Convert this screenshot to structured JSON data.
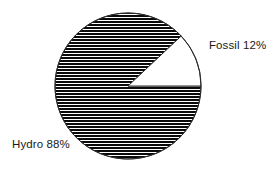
{
  "chart_data": {
    "type": "pie",
    "title": "",
    "labels": [
      "Hydro",
      "Fossil"
    ],
    "values": [
      88,
      12
    ],
    "value_unit": "%",
    "slice_labels": [
      "Hydro 88%",
      "Fossil 12%"
    ],
    "legend": "none",
    "grid": false,
    "slices": [
      {
        "name": "Hydro",
        "value": 88,
        "display": "Hydro 88%",
        "fill": "horizontal-hatch",
        "fill_color": "#000000",
        "start_angle_deg": 0,
        "end_angle_deg": 316.8
      },
      {
        "name": "Fossil",
        "value": 12,
        "display": "Fossil 12%",
        "fill": "solid",
        "fill_color": "#ffffff",
        "start_angle_deg": 316.8,
        "end_angle_deg": 360
      }
    ],
    "geometry": {
      "center_x": 128,
      "center_y": 86,
      "radius": 73,
      "stroke_color": "#2b2b2b",
      "background": "#ffffff"
    }
  },
  "labels": {
    "fossil": "Fossil 12%",
    "hydro": "Hydro 88%"
  }
}
